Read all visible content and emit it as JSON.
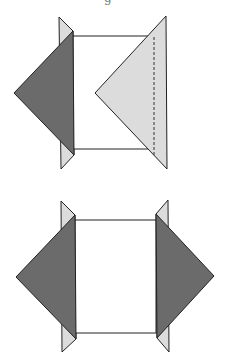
{
  "caption_fragment": "g",
  "colors": {
    "dark_fill": "#6b6b6b",
    "light_fill": "#dcdcdc",
    "face_fill": "#ffffff",
    "stroke": "#222222"
  },
  "figures": [
    {
      "id": "top",
      "description": "Square face with dark triangle flap folded out on the left and light triangle flap folded in on the right (dashed fold line)",
      "rect": {
        "x1": 73,
        "y1": 36,
        "x2": 155,
        "y2": 149
      },
      "left_strip": [
        [
          59,
          17
        ],
        [
          73,
          31
        ],
        [
          74,
          155
        ],
        [
          61,
          169
        ]
      ],
      "left_flap": [
        [
          73,
          31
        ],
        [
          14,
          93
        ],
        [
          74,
          155
        ]
      ],
      "right_flap": [
        [
          166,
          16
        ],
        [
          167,
          169
        ],
        [
          95,
          93
        ]
      ],
      "fold_line": {
        "x": 154,
        "y1": 37,
        "y2": 154
      }
    },
    {
      "id": "bottom",
      "description": "Square face with dark triangle flaps folded out on both left and right sides",
      "rect": {
        "x1": 75,
        "y1": 220,
        "x2": 156,
        "y2": 333
      },
      "left_strip": [
        [
          61,
          201
        ],
        [
          75,
          215
        ],
        [
          76,
          339
        ],
        [
          62,
          352
        ]
      ],
      "left_flap": [
        [
          75,
          215
        ],
        [
          16,
          277
        ],
        [
          76,
          339
        ]
      ],
      "right_strip": [
        [
          168,
          200
        ],
        [
          156,
          214
        ],
        [
          157,
          338
        ],
        [
          169,
          352
        ]
      ],
      "right_flap": [
        [
          156,
          214
        ],
        [
          214,
          276
        ],
        [
          157,
          338
        ]
      ]
    }
  ]
}
